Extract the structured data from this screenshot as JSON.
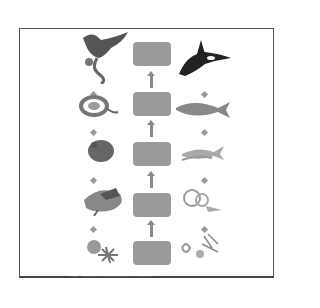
{
  "diagram": {
    "title": "",
    "colors": {
      "box": "#9a9a9a",
      "arrow": "#8a8a8a",
      "border": "#555555"
    },
    "levels": [
      {
        "box_label": "",
        "left_organism": "eagle-with-snake",
        "right_organism": "orca"
      },
      {
        "box_label": "",
        "left_organism": "snake",
        "right_organism": "tuna"
      },
      {
        "box_label": "",
        "left_organism": "rodent",
        "right_organism": "small-fish"
      },
      {
        "box_label": "",
        "left_organism": "grasshopper-on-plant",
        "right_organism": "zooplankton"
      },
      {
        "box_label": "",
        "left_organism": "flowering-plant",
        "right_organism": "phytoplankton"
      }
    ],
    "copyright": "Copyright © Pearson Education, Inc., publishing as Pearson Prentice Hall. All rights reserved."
  }
}
